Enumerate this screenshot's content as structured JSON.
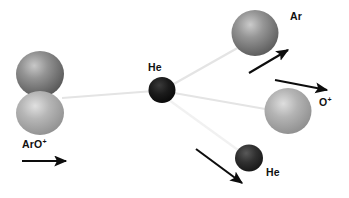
{
  "figure": {
    "type": "molecular-collision-diagram",
    "background_color": "#ffffff"
  },
  "labels": {
    "reactant_molecule": {
      "text": "ArO",
      "charge": "+",
      "name": "ArO+"
    },
    "target_atom": {
      "text": "He",
      "name": "He"
    },
    "product_ar": {
      "text": "Ar",
      "name": "Ar"
    },
    "product_o_plus": {
      "text": "O",
      "charge": "+",
      "name": "O+"
    },
    "product_he": {
      "text": "He",
      "name": "He"
    }
  },
  "particles": [
    {
      "id": "ar-reactant",
      "label": "Ar (in ArO+)",
      "cx": 40,
      "cy": 74,
      "r": 23,
      "fill": "#6e6e6e",
      "highlight": "#b9b9b9"
    },
    {
      "id": "o-reactant",
      "label": "O (in ArO+)",
      "cx": 40,
      "cy": 113,
      "r": 22,
      "fill": "#a3a3a3",
      "highlight": "#d8d8d8"
    },
    {
      "id": "he-target",
      "label": "He target",
      "cx": 162,
      "cy": 90,
      "r": 13,
      "fill": "#141414",
      "highlight": "#3c3c3c"
    },
    {
      "id": "ar-product",
      "label": "Ar product",
      "cx": 255,
      "cy": 33,
      "r": 23,
      "fill": "#6e6e6e",
      "highlight": "#bcbcbc"
    },
    {
      "id": "o-plus-product",
      "label": "O+ product",
      "cx": 288,
      "cy": 111,
      "r": 23,
      "fill": "#a3a3a3",
      "highlight": "#d6d6d6"
    },
    {
      "id": "he-product",
      "label": "He product",
      "cx": 249,
      "cy": 158,
      "r": 14,
      "fill": "#2b2b2b",
      "highlight": "#5a5a5a"
    }
  ],
  "trajectories": [
    {
      "id": "incoming-beam",
      "from": [
        62,
        98
      ],
      "to": [
        152,
        91
      ],
      "color": "#e2e2e2"
    },
    {
      "id": "outgoing-ar",
      "from": [
        172,
        85
      ],
      "to": [
        240,
        47
      ],
      "color": "#e2e2e2"
    },
    {
      "id": "outgoing-o-plus",
      "from": [
        174,
        93
      ],
      "to": [
        270,
        110
      ],
      "color": "#e2e2e2"
    },
    {
      "id": "outgoing-he",
      "from": [
        169,
        100
      ],
      "to": [
        238,
        150
      ],
      "color": "#f0f0f0"
    }
  ],
  "arrows": [
    {
      "id": "velocity-arrow-reactant",
      "from": [
        22,
        161
      ],
      "to": [
        69,
        161
      ],
      "color": "#0d0d0d"
    },
    {
      "id": "velocity-arrow-ar",
      "from": [
        249,
        73
      ],
      "to": [
        291,
        48
      ],
      "color": "#0d0d0d"
    },
    {
      "id": "velocity-arrow-o-plus",
      "from": [
        275,
        80
      ],
      "to": [
        330,
        91
      ],
      "color": "#0d0d0d"
    },
    {
      "id": "velocity-arrow-he",
      "from": [
        196,
        149
      ],
      "to": [
        245,
        186
      ],
      "color": "#0d0d0d"
    }
  ],
  "colors": {
    "argon_gray": "#6e6e6e",
    "oxygen_gray": "#a3a3a3",
    "helium_black": "#141414",
    "arrow_black": "#0d0d0d",
    "trajectory_gray": "#e2e2e2"
  }
}
